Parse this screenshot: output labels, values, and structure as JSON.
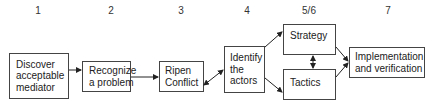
{
  "diagram": {
    "step_numbers": [
      "1",
      "2",
      "3",
      "4",
      "5/6",
      "7"
    ],
    "boxes": [
      {
        "id": "discover",
        "label": "Discover\nacceptable\nmediator"
      },
      {
        "id": "recognize",
        "label": "Recognize\na problem"
      },
      {
        "id": "ripen",
        "label": "Ripen\nConflict"
      },
      {
        "id": "identify",
        "label": "Identify\nthe\nactors"
      },
      {
        "id": "strategy",
        "label": "Strategy"
      },
      {
        "id": "tactics",
        "label": "Tactics"
      },
      {
        "id": "implementation",
        "label": "Implementation\nand verification"
      }
    ],
    "edges": [
      {
        "from": "discover",
        "to": "recognize",
        "type": "arrow"
      },
      {
        "from": "recognize",
        "to": "ripen",
        "type": "arrow"
      },
      {
        "from": "ripen",
        "to": "identify",
        "type": "bidirectional"
      },
      {
        "from": "identify",
        "to": "strategy",
        "type": "arrow"
      },
      {
        "from": "identify",
        "to": "tactics",
        "type": "arrow"
      },
      {
        "from": "strategy",
        "to": "tactics",
        "type": "bidirectional"
      },
      {
        "from": "strategy",
        "to": "implementation",
        "type": "arrow"
      },
      {
        "from": "tactics",
        "to": "implementation",
        "type": "arrow"
      }
    ],
    "colors": {
      "line": "#222222",
      "border": "#444444",
      "text": "#222222"
    }
  }
}
